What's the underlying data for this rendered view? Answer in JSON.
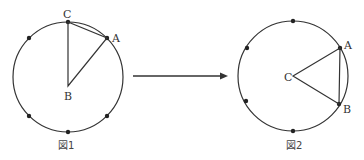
{
  "figure1": {
    "caption": "図1",
    "labels": {
      "A": "A",
      "B": "B",
      "C": "C"
    },
    "description": "Circle with 8 evenly spaced points; triangle ABC with B at center, C at top, A on circle"
  },
  "figure2": {
    "caption": "図2",
    "labels": {
      "A": "A",
      "B": "B",
      "C": "C"
    },
    "description": "Circle with points; triangle with C at center, A and B on right side of circle"
  },
  "arrow": {
    "direction": "right"
  },
  "colors": {
    "stroke": "#333333",
    "background": "#ffffff"
  }
}
